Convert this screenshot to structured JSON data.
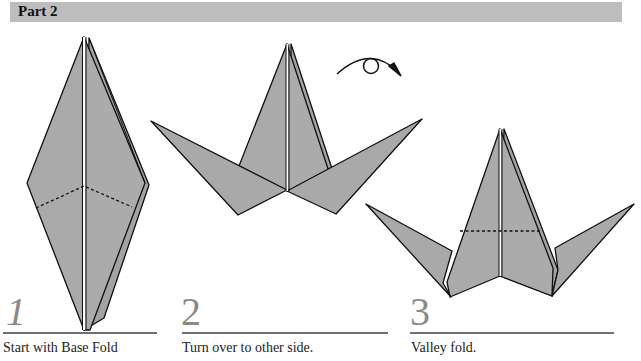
{
  "header": {
    "title": "Part 2"
  },
  "colors": {
    "paper": "#a9a9a9",
    "paper_dark": "#9a9a9a",
    "outline": "#111111",
    "header_bg": "#bdbdbd",
    "step_number": "#8a8a8a",
    "rule": "#6f6f6f"
  },
  "steps": [
    {
      "number": "1",
      "caption": "Start with Base Fold",
      "figure": "kite-base-with-dashed-fold-lines"
    },
    {
      "number": "2",
      "caption": "Turn over to other side.",
      "figure": "base-with-wings-and-turnover-arrow"
    },
    {
      "number": "3",
      "caption": "Valley fold.",
      "figure": "base-with-wings-and-valley-fold-line"
    }
  ],
  "icons": {
    "turnover": "turn-over-arrow-icon"
  }
}
